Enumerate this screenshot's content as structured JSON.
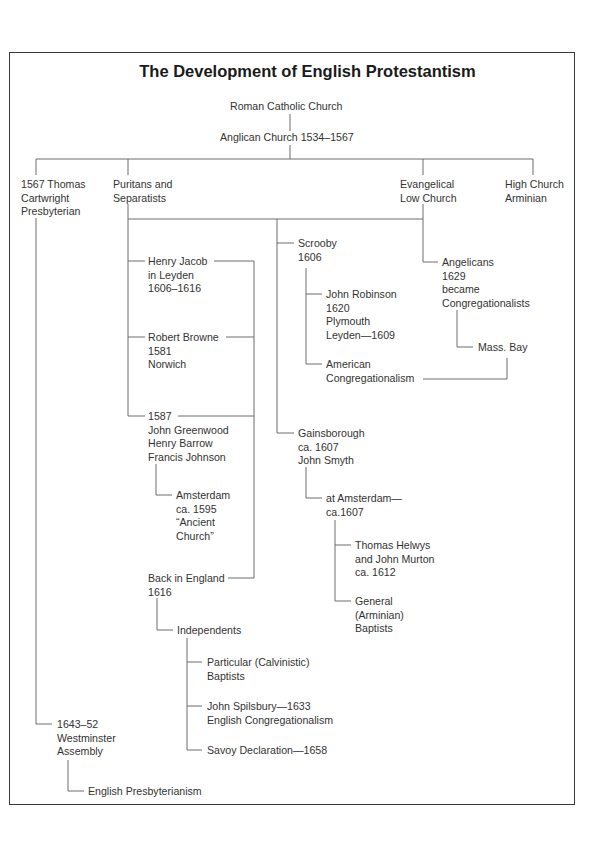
{
  "title": "The Development of English Protestantism",
  "nodes": {
    "roman_catholic": "Roman Catholic Church",
    "anglican": "Anglican Church 1534–1567",
    "cartwright": "1567 Thomas\nCartwright\nPresbyterian",
    "puritans": "Puritans and\nSeparatists",
    "evangelical": "Evangelical\nLow Church",
    "high_church": "High Church\nArminian",
    "henry_jacob": "Henry Jacob\nin Leyden\n1606–1616",
    "robert_browne": "Robert Browne\n1581\nNorwich",
    "greenwood": "1587\nJohn Greenwood\nHenry Barrow\nFrancis Johnson",
    "amsterdam_1595": "Amsterdam\nca. 1595\n“Ancient\nChurch”",
    "back_in_england": "Back in England\n1616",
    "independents": "Independents",
    "particular_baptists": "Particular (Calvinistic)\nBaptists",
    "spilsbury": "John Spilsbury—1633\nEnglish Congregationalism",
    "savoy": "Savoy Declaration—1658",
    "westminster": "1643–52\nWestminster\nAssembly",
    "english_presbyterianism": "English Presbyterianism",
    "scrooby": "Scrooby\n1606",
    "john_robinson": "John Robinson\n1620\nPlymouth\nLeyden—1609",
    "american_congregationalism": "American\nCongregationalism",
    "gainsborough": "Gainsborough\nca. 1607\nJohn Smyth",
    "at_amsterdam": "at Amsterdam—\nca.1607",
    "helwys": "Thomas Helwys\nand John Murton\nca. 1612",
    "general_baptists": "General\n(Arminian)\nBaptists",
    "angelicans": "Angelicans\n1629\nbecame\nCongregationalists",
    "mass_bay": "Mass. Bay"
  }
}
